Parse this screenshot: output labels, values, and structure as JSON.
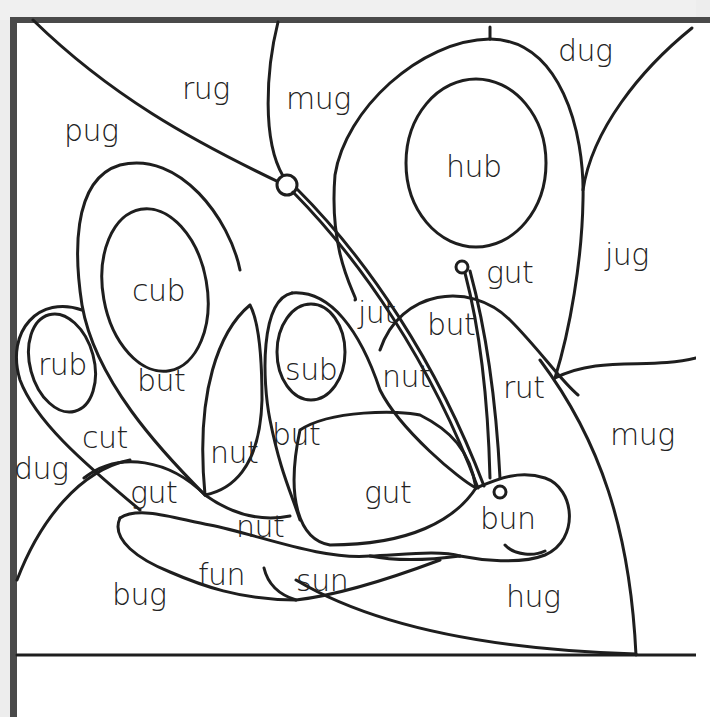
{
  "worksheet": {
    "type": "color-by-word picture",
    "subject": "butterfly"
  },
  "regions": [
    {
      "word": "rug",
      "x": 182,
      "y": 74
    },
    {
      "word": "mug",
      "x": 286,
      "y": 84
    },
    {
      "word": "dug",
      "x": 558,
      "y": 36
    },
    {
      "word": "pug",
      "x": 64,
      "y": 116
    },
    {
      "word": "hub",
      "x": 446,
      "y": 152
    },
    {
      "word": "jug",
      "x": 605,
      "y": 240
    },
    {
      "word": "gut",
      "x": 486,
      "y": 258
    },
    {
      "word": "cub",
      "x": 132,
      "y": 276
    },
    {
      "word": "jut",
      "x": 358,
      "y": 298
    },
    {
      "word": "but",
      "x": 427,
      "y": 310
    },
    {
      "word": "rub",
      "x": 38,
      "y": 350
    },
    {
      "word": "sub",
      "x": 285,
      "y": 355
    },
    {
      "word": "nut",
      "x": 382,
      "y": 362
    },
    {
      "word": "but",
      "x": 137,
      "y": 366
    },
    {
      "word": "rut",
      "x": 503,
      "y": 373
    },
    {
      "word": "cut",
      "x": 82,
      "y": 423
    },
    {
      "word": "mug",
      "x": 610,
      "y": 420
    },
    {
      "word": "but",
      "x": 272,
      "y": 420
    },
    {
      "word": "nut",
      "x": 210,
      "y": 438
    },
    {
      "word": "dug",
      "x": 14,
      "y": 454
    },
    {
      "word": "gut",
      "x": 130,
      "y": 478
    },
    {
      "word": "gut",
      "x": 364,
      "y": 478
    },
    {
      "word": "bun",
      "x": 480,
      "y": 504
    },
    {
      "word": "nut",
      "x": 236,
      "y": 512
    },
    {
      "word": "fun",
      "x": 198,
      "y": 560
    },
    {
      "word": "sun",
      "x": 296,
      "y": 566
    },
    {
      "word": "bug",
      "x": 112,
      "y": 580
    },
    {
      "word": "hug",
      "x": 506,
      "y": 582
    }
  ],
  "colors": {
    "line": "#1e1e1e",
    "border": "#4a4a4a",
    "paper": "#ffffff"
  }
}
